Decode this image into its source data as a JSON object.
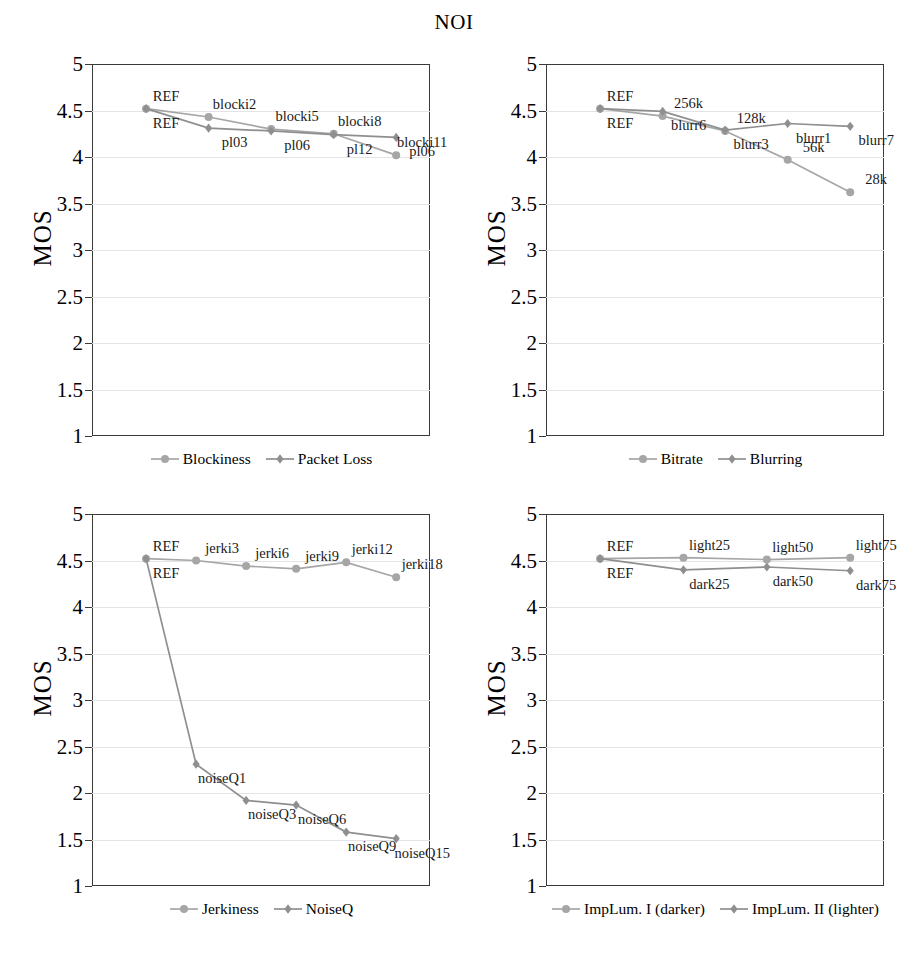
{
  "figure": {
    "title": "NOI",
    "background": "#ffffff",
    "axis_label": "MOS",
    "yticks": [
      "5",
      "4.5",
      "4",
      "3.5",
      "3",
      "2.5",
      "2",
      "1.5",
      "1"
    ],
    "series_colors": {
      "circle": "#a6a6a6",
      "diamond": "#8f8f8f"
    },
    "frame_color": "#3a3a3a",
    "grid_color": "#e3e3e8"
  },
  "chart_data": [
    {
      "type": "line",
      "panel": "top-left",
      "title": "NOI",
      "xlabel": "",
      "ylabel": "MOS",
      "ylim": [
        1,
        5
      ],
      "grid": true,
      "legend_position": "bottom",
      "x": [
        0,
        1,
        2,
        3,
        4
      ],
      "series": [
        {
          "name": "Blockiness",
          "marker": "circle",
          "color": "#a6a6a6",
          "values": [
            4.52,
            4.43,
            4.3,
            4.25,
            4.02
          ],
          "point_labels": [
            "REF",
            "blocki2",
            "blocki5",
            "blocki8",
            "blocki11"
          ]
        },
        {
          "name": "Packet Loss",
          "marker": "diamond",
          "color": "#8f8f8f",
          "values": [
            4.52,
            4.31,
            4.28,
            4.24,
            4.21
          ],
          "point_labels": [
            "REF",
            "pl03",
            "pl06",
            "pl12",
            "pl06"
          ]
        }
      ]
    },
    {
      "type": "line",
      "panel": "top-right",
      "title": "NOI",
      "xlabel": "",
      "ylabel": "MOS",
      "ylim": [
        1,
        5
      ],
      "grid": true,
      "legend_position": "bottom",
      "x": [
        0,
        1,
        2,
        3,
        4
      ],
      "series": [
        {
          "name": "Bitrate",
          "marker": "circle",
          "color": "#a6a6a6",
          "values": [
            4.52,
            4.44,
            4.28,
            3.97,
            3.62
          ],
          "point_labels": [
            "REF",
            "256k",
            "128k",
            "56k",
            "28k"
          ]
        },
        {
          "name": "Blurring",
          "marker": "diamond",
          "color": "#8f8f8f",
          "values": [
            4.52,
            4.49,
            4.29,
            4.36,
            4.33
          ],
          "point_labels": [
            "REF",
            "blurr6",
            "blurr3",
            "blurr1",
            "blurr7"
          ]
        }
      ]
    },
    {
      "type": "line",
      "panel": "bottom-left",
      "title": "NOI",
      "xlabel": "",
      "ylabel": "MOS",
      "ylim": [
        1,
        5
      ],
      "grid": true,
      "legend_position": "bottom",
      "x": [
        0,
        1,
        2,
        3,
        4,
        5
      ],
      "series": [
        {
          "name": "Jerkiness",
          "marker": "circle",
          "color": "#a6a6a6",
          "values": [
            4.52,
            4.5,
            4.44,
            4.41,
            4.48,
            4.32
          ],
          "point_labels": [
            "REF",
            "jerki3",
            "jerki6",
            "jerki9",
            "jerki12",
            "jerki18"
          ]
        },
        {
          "name": "NoiseQ",
          "marker": "diamond",
          "color": "#8f8f8f",
          "values": [
            4.52,
            2.31,
            1.92,
            1.87,
            1.58,
            1.51
          ],
          "point_labels": [
            "REF",
            "noiseQ1",
            "noiseQ3",
            "noiseQ6",
            "noiseQ9",
            "noiseQ15"
          ]
        }
      ]
    },
    {
      "type": "line",
      "panel": "bottom-right",
      "title": "NOI",
      "xlabel": "",
      "ylabel": "MOS",
      "ylim": [
        1,
        5
      ],
      "grid": true,
      "legend_position": "bottom",
      "x": [
        0,
        1,
        2,
        3
      ],
      "series": [
        {
          "name": "ImpLum. I (darker)",
          "marker": "circle",
          "color": "#a6a6a6",
          "values": [
            4.52,
            4.53,
            4.51,
            4.53
          ],
          "point_labels": [
            "REF",
            "light25",
            "light50",
            "light75"
          ]
        },
        {
          "name": "ImpLum. II (lighter)",
          "marker": "diamond",
          "color": "#8f8f8f",
          "values": [
            4.52,
            4.4,
            4.43,
            4.39
          ],
          "point_labels": [
            "REF",
            "dark25",
            "dark50",
            "dark75"
          ]
        }
      ]
    }
  ]
}
